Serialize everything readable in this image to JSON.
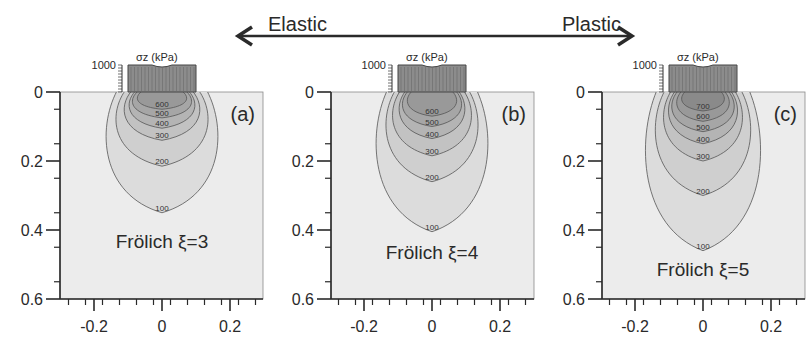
{
  "header": {
    "left_label": "Elastic",
    "right_label": "Plastic",
    "arrow": {
      "x1": 238,
      "x2": 632,
      "y": 36
    }
  },
  "colors": {
    "background": "#ffffff",
    "plot_bg": "#ececec",
    "contour_line": "#555555",
    "axis": "#2a2a2a",
    "load_fill": "#8c8c8c",
    "levels": {
      "100": "#dcdcdc",
      "200": "#cfcfcf",
      "300": "#c2c2c2",
      "400": "#b4b4b4",
      "500": "#a6a6a6",
      "600": "#999999",
      "700": "#8a8a8a"
    }
  },
  "chart_data": [
    {
      "type": "contour",
      "panel_label": "(a)",
      "annotation": "Frölich ξ=3",
      "load_label": "σz (kPa)",
      "load_scale_label": "1000",
      "xlabel": "",
      "ylabel": "",
      "xlim": [
        -0.3,
        0.3
      ],
      "ylim": [
        0.6,
        0
      ],
      "xticks": [
        "-0.2",
        "0",
        "0.2"
      ],
      "yticks": [
        "0",
        "0.2",
        "0.4",
        "0.6"
      ],
      "contour_levels": [
        100,
        200,
        300,
        400,
        500,
        600
      ],
      "contour_depths": {
        "100": 0.35,
        "200": 0.215,
        "300": 0.14,
        "400": 0.105,
        "500": 0.075,
        "600": 0.05
      },
      "contour_halfwidths": {
        "100": 0.17,
        "200": 0.14,
        "300": 0.115,
        "400": 0.1,
        "500": 0.09,
        "600": 0.075
      }
    },
    {
      "type": "contour",
      "panel_label": "(b)",
      "annotation": "Frölich ξ=4",
      "load_label": "σz (kPa)",
      "load_scale_label": "1000",
      "xlabel": "",
      "ylabel": "",
      "xlim": [
        -0.3,
        0.3
      ],
      "ylim": [
        0.6,
        0
      ],
      "xticks": [
        "-0.2",
        "0",
        "0.2"
      ],
      "yticks": [
        "0",
        "0.2",
        "0.4",
        "0.6"
      ],
      "contour_levels": [
        100,
        200,
        300,
        400,
        500,
        600
      ],
      "contour_depths": {
        "100": 0.405,
        "200": 0.26,
        "300": 0.185,
        "400": 0.135,
        "500": 0.1,
        "600": 0.07
      },
      "contour_halfwidths": {
        "100": 0.17,
        "200": 0.14,
        "300": 0.12,
        "400": 0.1,
        "500": 0.09,
        "600": 0.075
      }
    },
    {
      "type": "contour",
      "panel_label": "(c)",
      "annotation": "Frölich ξ=5",
      "load_label": "σz (kPa)",
      "load_scale_label": "1000",
      "xlabel": "",
      "ylabel": "",
      "xlim": [
        -0.3,
        0.3
      ],
      "ylim": [
        0.6,
        0
      ],
      "xticks": [
        "-0.2",
        "0",
        "0.2"
      ],
      "yticks": [
        "0",
        "0.2",
        "0.4",
        "0.6"
      ],
      "contour_levels": [
        100,
        200,
        300,
        400,
        500,
        600,
        700
      ],
      "contour_depths": {
        "100": 0.46,
        "200": 0.3,
        "300": 0.2,
        "400": 0.15,
        "500": 0.115,
        "600": 0.085,
        "700": 0.055
      },
      "contour_halfwidths": {
        "100": 0.175,
        "200": 0.145,
        "300": 0.12,
        "400": 0.105,
        "500": 0.095,
        "600": 0.08,
        "700": 0.065
      }
    }
  ],
  "layout": {
    "panels": [
      {
        "axis_x": 60,
        "right_x": 263,
        "zero_x": 162
      },
      {
        "axis_x": 331,
        "right_x": 534,
        "zero_x": 432
      },
      {
        "axis_x": 602,
        "right_x": 805,
        "zero_x": 703
      }
    ],
    "top_y": 92,
    "bottom_y": 299,
    "px_per_unit_x": 340,
    "px_per_unit_y": 345,
    "load_halfwidth": 0.1,
    "load_top_y": 65
  }
}
